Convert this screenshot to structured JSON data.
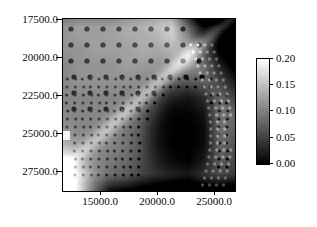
{
  "figure": {
    "kind": "pseudocolor-map-with-colorbar",
    "background_color": "#ffffff",
    "width": 317,
    "height": 227
  },
  "chart_data": {
    "type": "heatmap",
    "title": "",
    "subtitle": "",
    "xlabel": "",
    "ylabel": "",
    "grid": false,
    "legend_position": "right",
    "colormap": "grayscale",
    "colormap_low_color": "#000000",
    "colormap_high_color": "#ffffff",
    "xlim": [
      12000.0,
      27000.0
    ],
    "ylim": [
      28500.0,
      16800.0
    ],
    "y_axis_inverted": true,
    "xticks": [
      15000.0,
      20000.0,
      25000.0
    ],
    "xticklabels": [
      "15000.0",
      "20000.0",
      "25000.0"
    ],
    "yticks": [
      17500.0,
      20000.0,
      22500.0,
      25000.0,
      27500.0
    ],
    "yticklabels": [
      "17500.0",
      "20000.0",
      "22500.0",
      "25000.0",
      "27500.0"
    ],
    "zlim": [
      0.0,
      0.2
    ],
    "colorbar_ticks": [
      0.0,
      0.05,
      0.1,
      0.15,
      0.2
    ],
    "colorbar_ticklabels": [
      "0.00",
      "0.05",
      "0.10",
      "0.15",
      "0.20"
    ],
    "value_min": 0.0,
    "value_max": 0.2,
    "regions": [
      {
        "name": "upper-left-plateau",
        "approx_value": 0.105,
        "note": "medium gray field with coarse regular dot lattice"
      },
      {
        "name": "upper-right-dark-band",
        "approx_value": 0.035,
        "note": "dark wedge in top right corner"
      },
      {
        "name": "bright-diagonal-ridge",
        "approx_value": 0.165,
        "note": "light band running from top-center to right edge"
      },
      {
        "name": "central-dense-cell-zone",
        "approx_value": 0.085,
        "note": "fine lattice of small cells, mid-left to center"
      },
      {
        "name": "central-right-low-lobe",
        "approx_value": 0.005,
        "note": "large near-zero black lobe, center right"
      },
      {
        "name": "bottom-left-bright-corner",
        "approx_value": 0.195,
        "note": "white gradient corner at low x, high y"
      },
      {
        "name": "left-edge-highlight",
        "approx_value": 0.185,
        "note": "small bright notch at left edge near 25000"
      },
      {
        "name": "bottom-dark-margin",
        "approx_value": 0.03,
        "note": "dark band along bottom edge"
      }
    ],
    "field_grid": {
      "note": "coarse 12x12 sample of the underlying scalar field, row 0 = top (y=17500 side), values in 0..0.20",
      "nx": 12,
      "ny": 12,
      "values": [
        [
          0.11,
          0.12,
          0.12,
          0.12,
          0.13,
          0.14,
          0.15,
          0.17,
          0.1,
          0.05,
          0.04,
          0.06
        ],
        [
          0.11,
          0.12,
          0.12,
          0.12,
          0.13,
          0.13,
          0.14,
          0.16,
          0.12,
          0.05,
          0.04,
          0.05
        ],
        [
          0.11,
          0.11,
          0.12,
          0.12,
          0.12,
          0.13,
          0.13,
          0.14,
          0.13,
          0.08,
          0.05,
          0.05
        ],
        [
          0.1,
          0.11,
          0.11,
          0.11,
          0.12,
          0.12,
          0.12,
          0.12,
          0.12,
          0.1,
          0.06,
          0.05
        ],
        [
          0.1,
          0.11,
          0.11,
          0.11,
          0.11,
          0.11,
          0.11,
          0.1,
          0.09,
          0.08,
          0.07,
          0.06
        ],
        [
          0.1,
          0.1,
          0.1,
          0.1,
          0.1,
          0.1,
          0.09,
          0.06,
          0.03,
          0.04,
          0.08,
          0.07
        ],
        [
          0.1,
          0.1,
          0.1,
          0.1,
          0.1,
          0.09,
          0.07,
          0.02,
          0.01,
          0.02,
          0.09,
          0.08
        ],
        [
          0.11,
          0.1,
          0.1,
          0.1,
          0.09,
          0.08,
          0.04,
          0.01,
          0.0,
          0.01,
          0.09,
          0.07
        ],
        [
          0.13,
          0.11,
          0.1,
          0.1,
          0.09,
          0.07,
          0.03,
          0.0,
          0.0,
          0.01,
          0.08,
          0.06
        ],
        [
          0.16,
          0.12,
          0.1,
          0.09,
          0.08,
          0.06,
          0.03,
          0.01,
          0.0,
          0.02,
          0.07,
          0.05
        ],
        [
          0.19,
          0.15,
          0.1,
          0.08,
          0.07,
          0.05,
          0.04,
          0.03,
          0.02,
          0.04,
          0.05,
          0.04
        ],
        [
          0.2,
          0.17,
          0.11,
          0.06,
          0.05,
          0.04,
          0.03,
          0.03,
          0.03,
          0.03,
          0.03,
          0.03
        ]
      ]
    },
    "cell_overlay": {
      "note": "overlaid simulation cell outlines / well pattern drawn as dark dots on a lattice",
      "coarse_lattice": {
        "spacing_px": 16,
        "dot_radius_px": 2.6,
        "region": "upper-left"
      },
      "fine_lattice": {
        "spacing_px": 8,
        "dot_radius_px": 1.6,
        "region": "center and lower-left"
      }
    }
  },
  "axes": {
    "y_tick_labels": [
      "17500.0",
      "20000.0",
      "22500.0",
      "25000.0",
      "27500.0"
    ],
    "x_tick_labels": [
      "15000.0",
      "20000.0",
      "25000.0"
    ]
  },
  "colorbar": {
    "tick_labels": [
      "0.20",
      "0.15",
      "0.10",
      "0.05",
      "0.00"
    ]
  }
}
